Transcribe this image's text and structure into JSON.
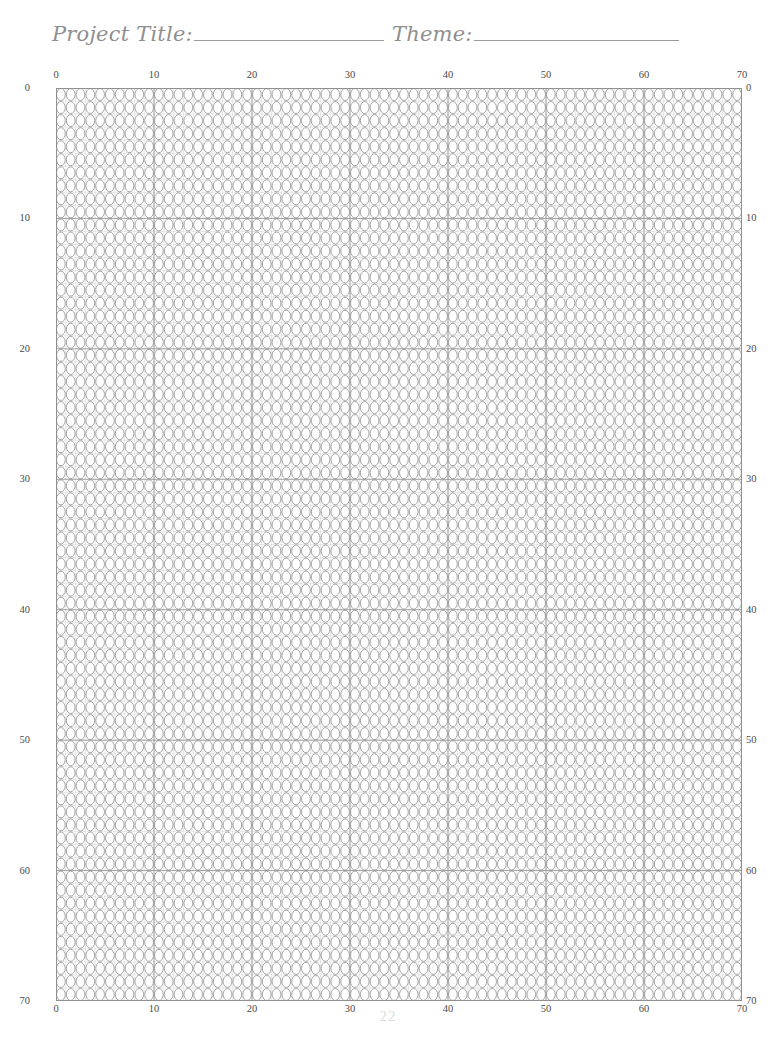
{
  "page": {
    "page_number": "22",
    "background_color": "#ffffff"
  },
  "header": {
    "fields": [
      {
        "label": "Project Title:",
        "value": "",
        "rule_width": 190
      },
      {
        "label": "Theme:",
        "value": "",
        "rule_width": 205
      }
    ],
    "label_color": "#8f8f8f",
    "rule_color": "#9a9a9a"
  },
  "grid": {
    "cell_shape": "ellipse",
    "columns": 70,
    "rows": 70,
    "cell_width": 9.8,
    "cell_height": 13.043,
    "origin_x": 56,
    "origin_y": 88,
    "width": 686,
    "height": 913,
    "minor_line_color": "#b4b4b4",
    "major_line_color": "#8c8c8c",
    "bead_stroke_color": "#8a8a8a",
    "bead_fill_color": "#ffffff",
    "major_every": 10,
    "border_color": "#8c8c8c"
  },
  "axes": {
    "tick_color": "#4a4a4a",
    "top": {
      "name": "column-axis-top",
      "ticks": [
        {
          "label": "0",
          "value": 0
        },
        {
          "label": "10",
          "value": 10
        },
        {
          "label": "20",
          "value": 20
        },
        {
          "label": "30",
          "value": 30
        },
        {
          "label": "40",
          "value": 40
        },
        {
          "label": "50",
          "value": 50
        },
        {
          "label": "60",
          "value": 60
        },
        {
          "label": "70",
          "value": 70
        }
      ]
    },
    "bottom": {
      "name": "column-axis-bottom",
      "ticks": [
        {
          "label": "0",
          "value": 0
        },
        {
          "label": "10",
          "value": 10
        },
        {
          "label": "20",
          "value": 20
        },
        {
          "label": "30",
          "value": 30
        },
        {
          "label": "40",
          "value": 40
        },
        {
          "label": "50",
          "value": 50
        },
        {
          "label": "60",
          "value": 60
        },
        {
          "label": "70",
          "value": 70
        }
      ]
    },
    "left": {
      "name": "row-axis-left",
      "ticks": [
        {
          "label": "0",
          "value": 0
        },
        {
          "label": "10",
          "value": 10
        },
        {
          "label": "20",
          "value": 20
        },
        {
          "label": "30",
          "value": 30
        },
        {
          "label": "40",
          "value": 40
        },
        {
          "label": "50",
          "value": 50
        },
        {
          "label": "60",
          "value": 60
        },
        {
          "label": "70",
          "value": 70
        }
      ]
    },
    "right": {
      "name": "row-axis-right",
      "ticks": [
        {
          "label": "0",
          "value": 0
        },
        {
          "label": "10",
          "value": 10
        },
        {
          "label": "20",
          "value": 20
        },
        {
          "label": "30",
          "value": 30
        },
        {
          "label": "40",
          "value": 40
        },
        {
          "label": "50",
          "value": 50
        },
        {
          "label": "60",
          "value": 60
        },
        {
          "label": "70",
          "value": 70
        }
      ]
    }
  }
}
